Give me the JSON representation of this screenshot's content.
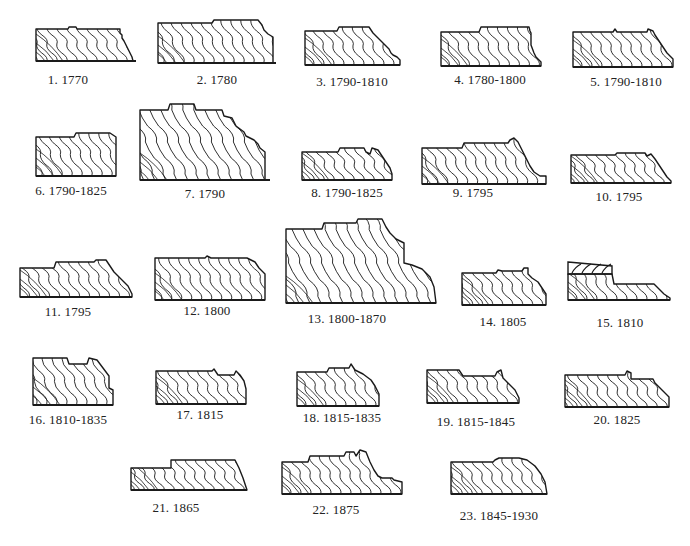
{
  "figure": {
    "background": "#ffffff",
    "ink": "#1a1a1a",
    "profiles": [
      {
        "num": "1.",
        "date": "1770",
        "label": "1. 1770",
        "box": [
          36,
          27,
          100,
          34
        ],
        "cap": [
          68,
          80
        ],
        "path": "M0,2 L32,2 L33,0 L40,0 L41,2 L84,2 L84,6 L86,8 L86,11 L88,14 L92,22 L96,30 L97,34 L0,34 Z"
      },
      {
        "num": "2.",
        "date": "1780",
        "label": "2. 1780",
        "box": [
          158,
          20,
          118,
          43
        ],
        "cap": [
          217,
          80
        ],
        "path": "M0,3 L54,3 L56,0 L100,0 L104,5 L106,10 L110,14 L115,17 L115,43 L0,43 Z"
      },
      {
        "num": "3.",
        "date": "1790-1810",
        "label": "3. 1790-1810",
        "box": [
          305,
          27,
          95,
          38
        ],
        "cap": [
          352,
          82
        ],
        "path": "M0,4 L32,4 L34,0 L64,0 L68,6 L72,10 L76,14 L80,18 L84,22 L86,26 L88,28 L92,30 L95,33 L95,38 L0,38 Z"
      },
      {
        "num": "4.",
        "date": "1780-1800",
        "label": "4. 1780-1800",
        "box": [
          441,
          27,
          100,
          39
        ],
        "cap": [
          490,
          80
        ],
        "path": "M0,5 L38,5 L40,0 L88,0 L89,4 L90,6 L90,18 L93,26 L95,30 L100,35 L100,39 L0,39 Z"
      },
      {
        "num": "5.",
        "date": "1790-1810",
        "label": "5. 1790-1810",
        "box": [
          573,
          29,
          100,
          38
        ],
        "cap": [
          626,
          82
        ],
        "path": "M0,3 L40,3 L42,0 L44,3 L74,3 L75,0 L80,2 L82,6 L86,12 L90,18 L94,24 L98,28 L100,30 L100,38 L0,38 Z"
      },
      {
        "num": "6.",
        "date": "1790-1825",
        "label": "6. 1790-1825",
        "box": [
          36,
          133,
          80,
          43
        ],
        "cap": [
          71,
          191
        ],
        "path": "M0,4 L38,4 L40,0 L74,0 L77,2 L80,4 L80,43 L0,43 Z"
      },
      {
        "num": "7.",
        "date": "1790",
        "label": "7. 1790",
        "box": [
          140,
          104,
          130,
          76
        ],
        "cap": [
          205,
          194
        ],
        "path": "M0,6 L28,6 L30,0 L54,0 L56,6 L82,6 L84,12 L92,14 L96,22 L104,28 L106,32 L114,36 L118,40 L120,44 L125,48 L125,76 L0,76 Z"
      },
      {
        "num": "8.",
        "date": "1790-1825",
        "label": "8. 1790-1825",
        "box": [
          302,
          148,
          90,
          32
        ],
        "cap": [
          347,
          193
        ],
        "path": "M0,4 L36,4 L38,0 L62,0 L64,4 L68,6 L70,0 L76,2 L80,8 L84,14 L88,20 L90,26 L90,32 L0,32 Z"
      },
      {
        "num": "9.",
        "date": "1795",
        "label": "9. 1795",
        "box": [
          422,
          140,
          124,
          44
        ],
        "cap": [
          473,
          193
        ],
        "path": "M0,8 L40,8 L42,3 L86,3 L88,0 L92,-2 L96,2 L100,10 L104,18 L108,26 L112,32 L118,36 L124,36 L124,44 L0,44 Z"
      },
      {
        "num": "10.",
        "date": "1795",
        "label": "10. 1795",
        "box": [
          571,
          153,
          100,
          30
        ],
        "cap": [
          619,
          197
        ],
        "path": "M0,2 L44,2 L46,0 L74,0 L76,3 L80,1 L84,6 L88,12 L92,18 L96,24 L100,28 L100,30 L0,30 Z"
      },
      {
        "num": "11.",
        "date": "1795",
        "label": "11. 1795",
        "box": [
          20,
          260,
          112,
          37
        ],
        "cap": [
          68,
          312
        ],
        "path": "M0,8 L34,8 L36,2 L74,2 L76,0 L86,0 L90,6 L94,12 L98,16 L104,22 L108,26 L112,34 L112,37 L0,37 Z"
      },
      {
        "num": "12.",
        "date": "1800",
        "label": "12. 1800",
        "box": [
          155,
          258,
          110,
          42
        ],
        "cap": [
          207,
          311
        ],
        "path": "M0,0 L50,0 L52,-2 L56,0 L92,0 L96,2 L100,4 L104,10 L110,16 L110,42 L0,42 Z"
      },
      {
        "num": "13.",
        "date": "1800-1870",
        "label": "13. 1800-1870",
        "box": [
          286,
          223,
          150,
          80
        ],
        "cap": [
          347,
          319
        ],
        "path": "M0,6 L36,6 L38,0 L70,0 L72,-4 L96,-4 L100,4 L104,10 L110,16 L118,20 L118,40 L126,42 L136,46 L144,54 L148,64 L150,80 L0,80 Z"
      },
      {
        "num": "14.",
        "date": "1805",
        "label": "14. 1805",
        "box": [
          462,
          270,
          84,
          35
        ],
        "cap": [
          503,
          322
        ],
        "path": "M0,3 L34,3 L36,0 L40,1 L60,1 L62,-2 L66,-2 L66,4 L70,8 L76,12 L80,18 L84,24 L84,35 L0,35 Z"
      },
      {
        "num": "15.",
        "date": "1810",
        "label": "15. 1810",
        "box": [
          568,
          262,
          102,
          38
        ],
        "cap": [
          620,
          323
        ],
        "path": "M0,12 L44,12 L46,22 L86,22 L88,24 L92,28 L96,32 L102,36 L102,38 L0,38 Z",
        "cap_strip": "M0,0 L44,4 L44,12 L0,12 Z"
      },
      {
        "num": "16.",
        "date": "1810-1835",
        "label": "16. 1810-1835",
        "box": [
          33,
          358,
          80,
          47
        ],
        "cap": [
          68,
          420
        ],
        "path": "M0,0 L34,0 L36,6 L54,6 L56,0 L64,2 L70,10 L76,18 L76,30 L80,32 L80,47 L0,47 Z"
      },
      {
        "num": "17.",
        "date": "1815",
        "label": "17. 1815",
        "box": [
          156,
          371,
          90,
          33
        ],
        "cap": [
          200,
          415
        ],
        "path": "M0,0 L56,0 L58,-2 L62,4 L78,4 L80,0 L84,4 L88,10 L90,18 L90,33 L0,33 Z"
      },
      {
        "num": "18.",
        "date": "1815-1835",
        "label": "18. 1815-1835",
        "box": [
          297,
          368,
          82,
          38
        ],
        "cap": [
          342,
          418
        ],
        "path": "M0,4 L30,4 L32,0 L52,0 L54,-4 L58,2 L66,6 L74,12 L78,18 L82,26 L82,38 L0,38 Z"
      },
      {
        "num": "19.",
        "date": "1815-1845",
        "label": "19. 1815-1845",
        "box": [
          427,
          368,
          92,
          35
        ],
        "cap": [
          476,
          422
        ],
        "path": "M0,2 L32,2 L36,8 L68,8 L70,4 L74,2 L76,10 L82,16 L88,22 L92,30 L92,35 L0,35 Z"
      },
      {
        "num": "20.",
        "date": "1825",
        "label": "20. 1825",
        "box": [
          565,
          375,
          104,
          32
        ],
        "cap": [
          617,
          420
        ],
        "path": "M0,0 L60,0 L62,-4 L66,-2 L66,4 L88,4 L90,8 L94,12 L98,16 L104,22 L104,32 L0,32 Z"
      },
      {
        "num": "21.",
        "date": "1865",
        "label": "21. 1865",
        "box": [
          131,
          460,
          116,
          30
        ],
        "cap": [
          176,
          508
        ],
        "path": "M0,8 L40,8 L40,0 L104,0 L108,8 L112,18 L116,30 L0,30 Z"
      },
      {
        "num": "22.",
        "date": "1875",
        "label": "22. 1875",
        "box": [
          282,
          456,
          120,
          38
        ],
        "cap": [
          336,
          510
        ],
        "path": "M0,6 L26,6 L28,0 L62,0 L64,-4 L72,-4 L74,0 L78,-6 L84,-4 L88,6 L92,14 L96,20 L100,22 L110,22 L112,24 L120,26 L120,38 L0,38 Z"
      },
      {
        "num": "23.",
        "date": "1845-1930",
        "label": "23. 1845-1930",
        "box": [
          451,
          460,
          96,
          34
        ],
        "cap": [
          499,
          516
        ],
        "path": "M0,2 L42,2 L44,0 L48,-2 L68,-2 L76,0 L84,6 L90,14 L94,22 L96,34 L0,34 Z"
      }
    ]
  }
}
